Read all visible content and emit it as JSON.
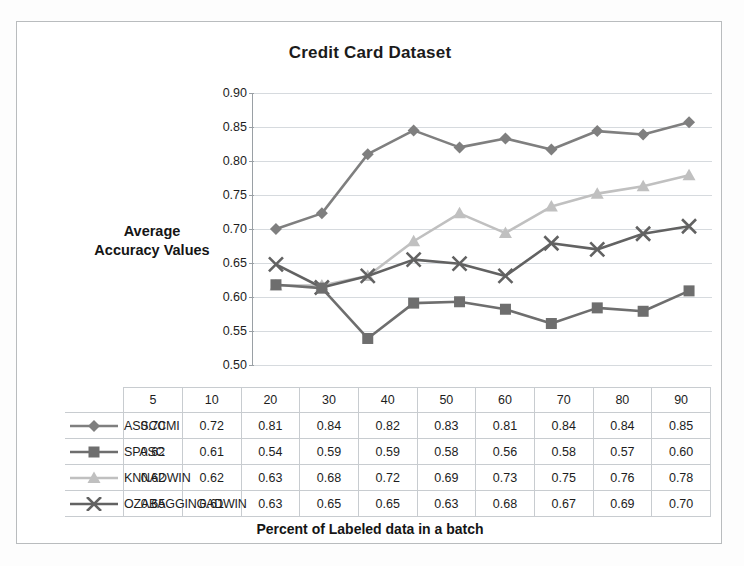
{
  "chart_data": {
    "type": "line",
    "title": "Credit Card Dataset",
    "xlabel": "Percent of Labeled data in a batch",
    "ylabel": "Average Accuracy Values",
    "ylabel_line1": "Average",
    "ylabel_line2": "Accuracy Values",
    "categories": [
      "5",
      "10",
      "20",
      "30",
      "40",
      "50",
      "60",
      "70",
      "80",
      "90"
    ],
    "ylim": [
      0.5,
      0.9
    ],
    "ytick_labels": [
      "0.90",
      "0.85",
      "0.80",
      "0.75",
      "0.70",
      "0.65",
      "0.60",
      "0.55",
      "0.50"
    ],
    "ytick_values": [
      0.9,
      0.85,
      0.8,
      0.75,
      0.7,
      0.65,
      0.6,
      0.55,
      0.5
    ],
    "grid": true,
    "legend_position": "data-table-left",
    "series": [
      {
        "name": "ASSCCMI",
        "marker": "diamond",
        "color": "#7f7f7f",
        "values": [
          0.7,
          0.72,
          0.81,
          0.84,
          0.82,
          0.83,
          0.81,
          0.84,
          0.84,
          0.85
        ],
        "plotted": [
          0.7,
          0.723,
          0.81,
          0.845,
          0.82,
          0.833,
          0.817,
          0.844,
          0.839,
          0.857
        ],
        "labels": [
          "0.70",
          "0.72",
          "0.81",
          "0.84",
          "0.82",
          "0.83",
          "0.81",
          "0.84",
          "0.84",
          "0.85"
        ]
      },
      {
        "name": "SPASC",
        "marker": "square",
        "color": "#6e6e6e",
        "values": [
          0.62,
          0.61,
          0.54,
          0.59,
          0.59,
          0.58,
          0.56,
          0.58,
          0.57,
          0.6
        ],
        "plotted": [
          0.618,
          0.613,
          0.539,
          0.591,
          0.593,
          0.582,
          0.561,
          0.584,
          0.579,
          0.609
        ],
        "labels": [
          "0.62",
          "0.61",
          "0.54",
          "0.59",
          "0.59",
          "0.58",
          "0.56",
          "0.58",
          "0.57",
          "0.60"
        ]
      },
      {
        "name": "KNNADWIN",
        "marker": "triangle",
        "color": "#c0c0c0",
        "values": [
          0.62,
          0.62,
          0.63,
          0.68,
          0.72,
          0.69,
          0.73,
          0.75,
          0.76,
          0.78
        ],
        "plotted": [
          0.617,
          0.617,
          0.631,
          0.682,
          0.723,
          0.694,
          0.733,
          0.752,
          0.763,
          0.779
        ],
        "labels": [
          "0.62",
          "0.62",
          "0.63",
          "0.68",
          "0.72",
          "0.69",
          "0.73",
          "0.75",
          "0.76",
          "0.78"
        ]
      },
      {
        "name": "OZABAGGINGADWIN",
        "marker": "x",
        "color": "#626262",
        "values": [
          0.65,
          0.61,
          0.63,
          0.65,
          0.65,
          0.63,
          0.68,
          0.67,
          0.69,
          0.7
        ],
        "plotted": [
          0.648,
          0.614,
          0.631,
          0.655,
          0.649,
          0.631,
          0.679,
          0.67,
          0.693,
          0.704
        ],
        "labels": [
          "0.65",
          "0.61",
          "0.63",
          "0.65",
          "0.65",
          "0.63",
          "0.68",
          "0.67",
          "0.69",
          "0.70"
        ]
      }
    ]
  }
}
